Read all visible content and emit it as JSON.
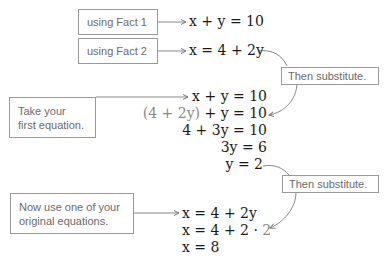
{
  "callouts": {
    "fact1": "using Fact 1",
    "fact2": "using Fact 2",
    "substitute1": "Then substitute.",
    "take_first_line1": "Take your",
    "take_first_line2": "first equation.",
    "substitute2": "Then substitute.",
    "now_use_line1": "Now use one of your",
    "now_use_line2": "original equations."
  },
  "equations": {
    "eq1": "x + y = 10",
    "eq2": "x = 4 + 2y",
    "step1": "x + y = 10",
    "step2_sub": "(4 + 2y)",
    "step2_rest": " + y = 10",
    "step3": "4 + 3y = 10",
    "step4": "3y = 6",
    "step5": "y = 2",
    "final1": "x = 4 + 2y",
    "final2_main": "x = 4 + 2 · ",
    "final2_sub": "2",
    "final3": "x = 8"
  }
}
